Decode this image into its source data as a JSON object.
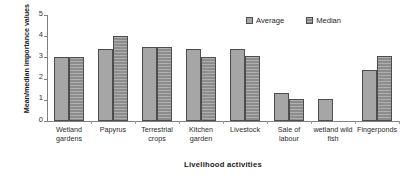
{
  "chart_data": {
    "type": "bar",
    "title": "",
    "xlabel": "Livelihood activities",
    "ylabel": "Mean/median importance values",
    "ylim": [
      0,
      5
    ],
    "yticks": [
      0,
      1,
      2,
      3,
      4,
      5
    ],
    "grid": false,
    "legend_position": "top-right",
    "categories": [
      "Wetland gardens",
      "Papyrus",
      "Terrestrial crops",
      "Kitchen garden",
      "Livestock",
      "Sale of labour",
      "wetland wild fish",
      "Fingerponds"
    ],
    "category_lines": [
      [
        "Wetland",
        "gardens"
      ],
      [
        "Papyrus"
      ],
      [
        "Terrestrial",
        "crops"
      ],
      [
        "Kitchen",
        "garden"
      ],
      [
        "Livestock"
      ],
      [
        "Sale of",
        "labour"
      ],
      [
        "wetland wild",
        "fish"
      ],
      [
        "Fingerponds"
      ]
    ],
    "series": [
      {
        "name": "Average",
        "color": "#a6a6a6",
        "values": [
          3.0,
          3.4,
          3.5,
          3.4,
          3.4,
          1.3,
          1.05,
          2.4
        ]
      },
      {
        "name": "Median",
        "color": "#8c8c8c",
        "values": [
          3.0,
          4.0,
          3.5,
          3.0,
          3.05,
          1.05,
          null,
          3.05
        ]
      }
    ]
  },
  "legend": {
    "items": [
      {
        "label": "Average",
        "swatch": "average-swatch"
      },
      {
        "label": "Median",
        "swatch": "median-swatch"
      }
    ]
  },
  "axes": {
    "y_tick_labels": [
      "0",
      "1",
      "2",
      "3",
      "4",
      "5"
    ]
  }
}
